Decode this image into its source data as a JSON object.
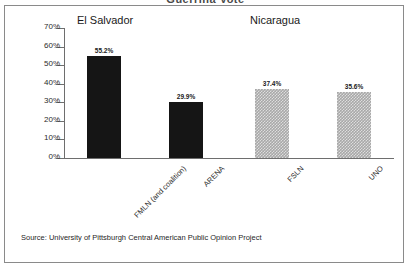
{
  "title_cropped": "Guerrilla Vote",
  "groups": [
    {
      "label": "El Salvador"
    },
    {
      "label": "Nicaragua"
    }
  ],
  "source_note": "Source:  University of Pittsburgh Central American Public Opinion Project",
  "colors": {
    "bar_solid": "#151515",
    "bar_hatched": "#a8a8a8",
    "axis": "#6e6e6e",
    "frame": "#8a8a8a",
    "text": "#1a1a1a"
  },
  "chart_data": {
    "type": "bar",
    "title": "Guerrilla Vote",
    "xlabel": "",
    "ylabel": "",
    "ylim": [
      0,
      70
    ],
    "ytick_labels": [
      "0%",
      "10%",
      "20%",
      "30%",
      "40%",
      "50%",
      "60%",
      "70%"
    ],
    "ytick_values": [
      0,
      10,
      20,
      30,
      40,
      50,
      60,
      70
    ],
    "grid": false,
    "legend": "none",
    "categories": [
      "FMLN (and coalition)",
      "ARENA",
      "FSLN",
      "UNO"
    ],
    "values": [
      55.2,
      29.9,
      37.4,
      35.6
    ],
    "value_labels": [
      "55.2%",
      "29.9%",
      "37.4%",
      "35.6%"
    ],
    "bar_styles": [
      "solid",
      "solid",
      "hatched",
      "hatched"
    ],
    "group_of_bar": [
      "El Salvador",
      "El Salvador",
      "Nicaragua",
      "Nicaragua"
    ],
    "annotations": [
      "Source:  University of Pittsburgh Central American Public Opinion Project"
    ]
  }
}
